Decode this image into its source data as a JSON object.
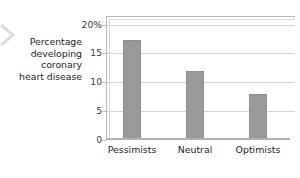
{
  "figure": {
    "background_color": "#ffffff",
    "bar_color": "#9a9a9a",
    "gridline_color": "#d5d5d5",
    "axis_color": "#b9b9b9",
    "text_color": "#231f20"
  },
  "y_axis_title_lines": [
    "Percentage",
    "developing",
    "coronary",
    "heart disease"
  ],
  "icons": {
    "edge_chevron": "chevron-right-icon"
  },
  "chart_data": {
    "type": "bar",
    "title": "",
    "xlabel": "",
    "ylabel": "Percentage developing coronary heart disease",
    "categories": [
      "Pessimists",
      "Neutral",
      "Optimists"
    ],
    "values": [
      17.4,
      12.0,
      8.0
    ],
    "ylim": [
      0,
      21.5
    ],
    "yticks": [
      0,
      5,
      10,
      15,
      20
    ],
    "ytick_labels": [
      "0",
      "5",
      "10",
      "15",
      "20%"
    ],
    "grid": true,
    "legend": "none",
    "orientation": "vertical"
  }
}
